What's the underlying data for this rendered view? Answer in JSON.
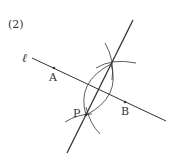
{
  "problem_number": "(2)",
  "line_label": "ℓ",
  "points": {
    "A": {
      "label": "A",
      "x": 54,
      "y": 68
    },
    "B": {
      "label": "B",
      "x": 125,
      "y": 102
    },
    "P": {
      "label": "P",
      "x": 86,
      "y": 115
    }
  },
  "colors": {
    "ink": "#333333",
    "background": "#ffffff"
  }
}
